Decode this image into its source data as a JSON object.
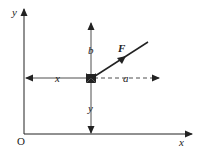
{
  "diagram": {
    "type": "force-position-diagram",
    "colors": {
      "line": "#222222",
      "background": "#ffffff"
    },
    "axes": {
      "origin_label": "O",
      "x_axis_label": "x",
      "y_axis_label": "y"
    },
    "point": {
      "marker": "cross-arrowheads"
    },
    "dimensions": {
      "horizontal_distance_label": "x",
      "vertical_distance_label": "y",
      "b_label": "b",
      "a_label": "a"
    },
    "force": {
      "label": "F"
    }
  }
}
